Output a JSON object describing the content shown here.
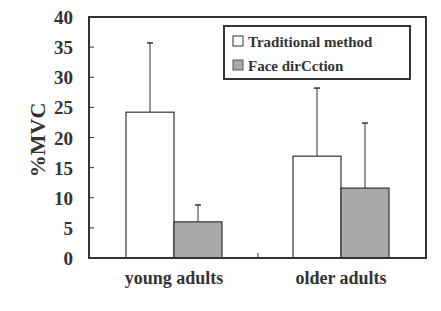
{
  "chart_data": {
    "type": "bar",
    "title": "",
    "xlabel": "",
    "ylabel": "%MVC",
    "ylim": [
      0,
      40
    ],
    "yticks": [
      0,
      5,
      10,
      15,
      20,
      25,
      30,
      35,
      40
    ],
    "grid": false,
    "legend_position": "top-right",
    "categories": [
      "young adults",
      "older adults"
    ],
    "series": [
      {
        "name": "Traditional method",
        "color": "#ffffff",
        "values": [
          24.2,
          16.9
        ],
        "error_upper": [
          35.7,
          28.2
        ]
      },
      {
        "name": "Face direction",
        "color": "#a9a9a9",
        "values": [
          6.0,
          11.6
        ],
        "error_upper": [
          8.8,
          22.4
        ]
      }
    ]
  },
  "labels": {
    "ylabel": "%MVC",
    "cat0": "young adults",
    "cat1": "older adults",
    "legend0": "Traditional method",
    "legend1": "Face dirCction"
  }
}
